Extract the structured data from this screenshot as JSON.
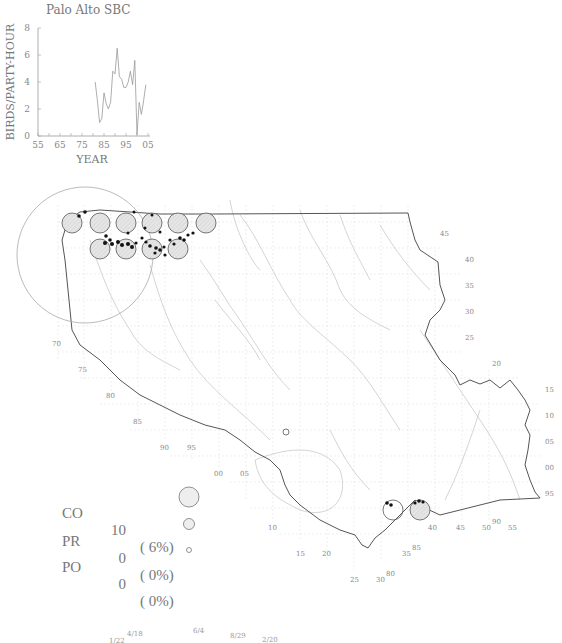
{
  "chart_title": "Palo Alto SBC",
  "chart_data": {
    "type": "line",
    "title": "Palo Alto SBC",
    "xlabel": "YEAR",
    "ylabel": "BIRDS/PARTY-HOUR",
    "xlim": [
      1955,
      2005
    ],
    "ylim": [
      0,
      8
    ],
    "x_tick_labels": [
      "55",
      "65",
      "75",
      "85",
      "95",
      "05"
    ],
    "y_tick_labels": [
      "0",
      "2",
      "4",
      "6",
      "8"
    ],
    "grid": false,
    "x": [
      1981,
      1982,
      1983,
      1984,
      1985,
      1986,
      1987,
      1988,
      1989,
      1990,
      1991,
      1992,
      1993,
      1994,
      1995,
      1996,
      1997,
      1998,
      1999,
      2000,
      2001,
      2002,
      2003,
      2004
    ],
    "values": [
      4.0,
      2.6,
      1.0,
      1.3,
      3.2,
      2.4,
      2.0,
      2.5,
      4.8,
      4.6,
      6.5,
      4.4,
      4.2,
      3.6,
      3.6,
      4.0,
      4.8,
      3.8,
      5.6,
      0.1,
      2.5,
      1.6,
      2.6,
      3.8
    ]
  },
  "map": {
    "right_labels": [
      "45",
      "40",
      "35",
      "30",
      "25",
      "20",
      "15",
      "10",
      "05",
      "00",
      "95"
    ],
    "left_labels": [
      "70",
      "75",
      "80",
      "85",
      "90",
      "95",
      "00",
      "05",
      "10",
      "15",
      "20",
      "25",
      "30"
    ],
    "bottom_labels": [
      "35",
      "40",
      "45",
      "50",
      "55"
    ],
    "extra_labels": [
      "85",
      "80",
      "90"
    ]
  },
  "legend": {
    "rows": [
      {
        "code": "CO",
        "count": "10",
        "pct": "( 6%)",
        "symbol": "large-circle"
      },
      {
        "code": "PR",
        "count": "0",
        "pct": "( 0%)",
        "symbol": "medium-circle"
      },
      {
        "code": "PO",
        "count": "0",
        "pct": "( 0%)",
        "symbol": "small-circle"
      }
    ]
  },
  "dates": [
    "1/22",
    "4/18",
    "6/4",
    "8/29",
    "2/20"
  ]
}
